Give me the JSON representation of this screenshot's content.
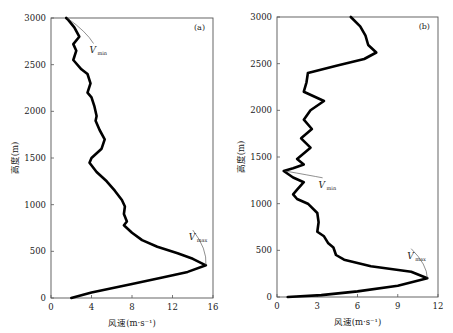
{
  "chart_data": [
    {
      "type": "line",
      "panel_label": "(a)",
      "xlabel": "风速(m·s⁻¹)",
      "ylabel": "高度(m)",
      "xlim": [
        0,
        16
      ],
      "ylim": [
        0,
        3000
      ],
      "xticks": [
        0,
        4,
        8,
        12,
        16
      ],
      "yticks": [
        0,
        500,
        1000,
        1500,
        2000,
        2500,
        3000
      ],
      "grid": false,
      "series": [
        {
          "name": "wind profile (a)",
          "points": [
            [
              2.0,
              0
            ],
            [
              4.0,
              60
            ],
            [
              8.0,
              150
            ],
            [
              11.0,
              220
            ],
            [
              13.5,
              280
            ],
            [
              15.3,
              350
            ],
            [
              14.0,
              420
            ],
            [
              12.5,
              480
            ],
            [
              10.5,
              550
            ],
            [
              9.0,
              620
            ],
            [
              8.0,
              700
            ],
            [
              7.2,
              780
            ],
            [
              7.5,
              820
            ],
            [
              7.2,
              900
            ],
            [
              7.3,
              980
            ],
            [
              7.0,
              1050
            ],
            [
              6.3,
              1150
            ],
            [
              5.5,
              1250
            ],
            [
              4.5,
              1350
            ],
            [
              3.8,
              1450
            ],
            [
              4.0,
              1500
            ],
            [
              5.0,
              1600
            ],
            [
              5.3,
              1700
            ],
            [
              4.8,
              1800
            ],
            [
              4.4,
              1900
            ],
            [
              4.5,
              1950
            ],
            [
              4.3,
              2050
            ],
            [
              4.0,
              2150
            ],
            [
              3.6,
              2200
            ],
            [
              3.9,
              2300
            ],
            [
              3.6,
              2400
            ],
            [
              3.0,
              2450
            ],
            [
              2.2,
              2550
            ],
            [
              2.5,
              2650
            ],
            [
              2.2,
              2720
            ],
            [
              2.8,
              2800
            ],
            [
              2.3,
              2900
            ],
            [
              1.7,
              2980
            ],
            [
              1.5,
              3000
            ]
          ]
        }
      ],
      "annotations": [
        {
          "label": "V",
          "sub": "min",
          "at": [
            1.6,
            3000
          ],
          "text_at": [
            4.2,
            2620
          ]
        },
        {
          "label": "V",
          "sub": "max",
          "at": [
            15.3,
            350
          ],
          "text_at": [
            14.0,
            620
          ]
        }
      ]
    },
    {
      "type": "line",
      "panel_label": "(b)",
      "xlabel": "风速(m·s⁻¹)",
      "ylabel": "高度(m)",
      "xlim": [
        0,
        12
      ],
      "ylim": [
        0,
        3000
      ],
      "xticks": [
        0,
        3,
        6,
        9,
        12
      ],
      "yticks": [
        0,
        500,
        1000,
        1500,
        2000,
        2500,
        3000
      ],
      "grid": false,
      "series": [
        {
          "name": "wind profile (b)",
          "points": [
            [
              0.8,
              0
            ],
            [
              3.3,
              20
            ],
            [
              6.0,
              60
            ],
            [
              9.0,
              120
            ],
            [
              11.2,
              200
            ],
            [
              10.0,
              270
            ],
            [
              7.0,
              330
            ],
            [
              5.0,
              400
            ],
            [
              4.4,
              450
            ],
            [
              4.2,
              530
            ],
            [
              3.8,
              580
            ],
            [
              3.5,
              650
            ],
            [
              3.0,
              700
            ],
            [
              3.1,
              800
            ],
            [
              3.0,
              900
            ],
            [
              2.3,
              1000
            ],
            [
              1.5,
              1050
            ],
            [
              1.2,
              1100
            ],
            [
              1.5,
              1150
            ],
            [
              2.0,
              1230
            ],
            [
              1.2,
              1280
            ],
            [
              0.5,
              1350
            ],
            [
              1.2,
              1380
            ],
            [
              2.0,
              1420
            ],
            [
              1.5,
              1480
            ],
            [
              2.5,
              1600
            ],
            [
              1.8,
              1700
            ],
            [
              2.6,
              1800
            ],
            [
              2.0,
              1900
            ],
            [
              2.5,
              2000
            ],
            [
              3.5,
              2100
            ],
            [
              2.0,
              2200
            ],
            [
              2.2,
              2300
            ],
            [
              2.3,
              2400
            ],
            [
              4.5,
              2480
            ],
            [
              6.5,
              2550
            ],
            [
              7.4,
              2620
            ],
            [
              6.8,
              2700
            ],
            [
              6.6,
              2800
            ],
            [
              6.2,
              2900
            ],
            [
              5.5,
              3000
            ]
          ]
        }
      ],
      "annotations": [
        {
          "label": "V",
          "sub": "min",
          "at": [
            0.6,
            1350
          ],
          "text_at": [
            3.4,
            1170
          ]
        },
        {
          "label": "V",
          "sub": "max",
          "at": [
            11.2,
            200
          ],
          "text_at": [
            10.0,
            410
          ]
        }
      ]
    }
  ]
}
